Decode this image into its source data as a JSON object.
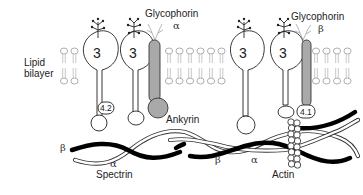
{
  "labels": {
    "lipid_bilayer_line1": "Lipid",
    "lipid_bilayer_line2": "bilayer",
    "glycophorin_alpha_name": "Glycophorin",
    "glycophorin_alpha_symbol": "α",
    "glycophorin_beta_name": "Glycophorin",
    "glycophorin_beta_symbol": "β",
    "band3": "3",
    "protein_4_2": "4.2",
    "protein_4_1": "4.1",
    "ankyrin": "Ankyrin",
    "spectrin": "Spectrin",
    "actin": "Actin",
    "spectrin_beta": "β",
    "spectrin_alpha": "α"
  },
  "components": [
    "lipid-bilayer",
    "band-3-protein",
    "glycophorin-alpha",
    "glycophorin-beta",
    "protein-4.2",
    "ankyrin",
    "protein-4.1",
    "spectrin-alpha",
    "spectrin-beta",
    "actin-filament"
  ],
  "colors": {
    "glycophorin": "#a9a9a9",
    "ankyrin": "#a9a9a9",
    "spectrin_beta": "#000000",
    "outline": "#222222"
  }
}
